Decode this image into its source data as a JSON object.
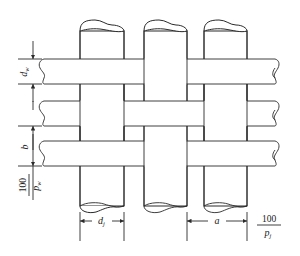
{
  "diagram": {
    "type": "woven-wire-mesh-cross-section",
    "labels": {
      "weft_diameter": "d",
      "weft_diameter_sub": "w",
      "weft_spacing": "b",
      "weft_pitch_num": "100",
      "weft_pitch_den": "p",
      "weft_pitch_den_sub": "w",
      "warp_diameter": "d",
      "warp_diameter_sub": "j",
      "warp_spacing": "a",
      "warp_pitch_num": "100",
      "warp_pitch_den": "p",
      "warp_pitch_den_sub": "j"
    },
    "colors": {
      "line": "#2a2a2a",
      "background": "#ffffff"
    }
  }
}
